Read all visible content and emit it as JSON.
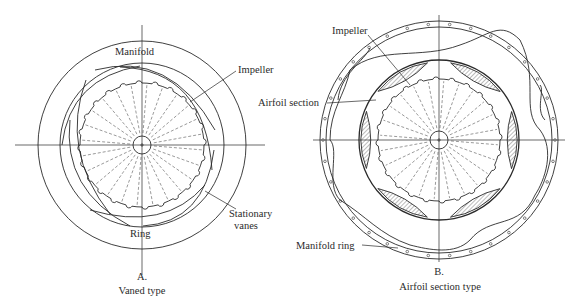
{
  "figures": [
    {
      "id": "A",
      "caption_letter": "A.",
      "caption_title": "Vaned type",
      "center": [
        142,
        145
      ],
      "outer_radius": 104,
      "impeller_radius": 62,
      "hub_radius": 9,
      "notch_count": 24,
      "labels": {
        "manifold": "Manifold",
        "impeller": "Impeller",
        "ring": "Ring",
        "stationary_vanes_1": "Stationary",
        "stationary_vanes_2": "vanes"
      }
    },
    {
      "id": "B",
      "caption_letter": "B.",
      "caption_title": "Airfoil section type",
      "center": [
        439,
        140
      ],
      "outer_radius": 119,
      "casing_radius": 80,
      "impeller_radius": 61,
      "hub_radius": 9,
      "notch_count": 24,
      "labels": {
        "impeller": "Impeller",
        "airfoil_section": "Airfoil section",
        "manifold_ring": "Manifold ring"
      }
    }
  ],
  "colors": {
    "line": "#2a2a2a",
    "dashed": "#555555",
    "hatch": "#8a8a8a",
    "background": "#ffffff"
  }
}
